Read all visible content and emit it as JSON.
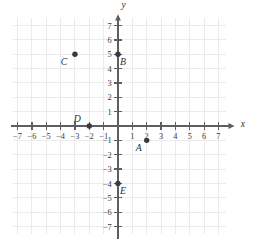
{
  "figure": {
    "title": "",
    "background_color": "#ffffff",
    "axis_color": "#5d5d62",
    "grid_color": "#e9e9ec",
    "point_color": "#3a3a40",
    "label_color": "#2e2e33"
  },
  "chart_data": {
    "type": "scatter",
    "title": "",
    "xlabel": "x",
    "ylabel": "y",
    "xlim": [
      -7.5,
      7.6
    ],
    "ylim": [
      -7.6,
      7.5
    ],
    "grid": true,
    "grid_step": 1,
    "legend": "none",
    "x_ticks": [
      -7,
      -6,
      -5,
      -4,
      -3,
      -2,
      -1,
      1,
      2,
      3,
      4,
      5,
      6,
      7
    ],
    "x_tick_labels": [
      "-7",
      "-6",
      "-5",
      "-4",
      "-3",
      "-2",
      "-1",
      "1",
      "2",
      "3",
      "4",
      "5",
      "6",
      "7"
    ],
    "y_ticks": [
      -7,
      -6,
      -5,
      -4,
      -3,
      -2,
      -1,
      1,
      2,
      3,
      4,
      5,
      6,
      7
    ],
    "y_tick_labels": [
      "-7",
      "-6",
      "-5",
      "-4",
      "-3",
      "-2",
      "-1",
      "1",
      "2",
      "3",
      "4",
      "5",
      "6",
      "7"
    ],
    "points": [
      {
        "label": "A",
        "x": 2,
        "y": -1,
        "label_dx": -8,
        "label_dy": 11
      },
      {
        "label": "B",
        "x": 0,
        "y": 5,
        "label_dx": 5,
        "label_dy": 11
      },
      {
        "label": "C",
        "x": -3,
        "y": 5,
        "label_dx": -11,
        "label_dy": 11
      },
      {
        "label": "D",
        "x": -2,
        "y": 0,
        "label_dx": -12,
        "label_dy": -4
      },
      {
        "label": "E",
        "x": 0,
        "y": -4,
        "label_dx": 5,
        "label_dy": 11
      }
    ]
  }
}
